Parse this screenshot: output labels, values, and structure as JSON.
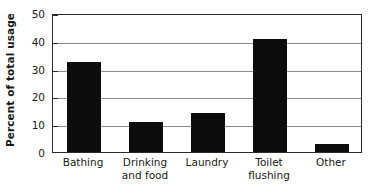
{
  "chart_data": {
    "type": "bar",
    "title": "",
    "xlabel": "",
    "ylabel": "Percent of total usage",
    "categories": [
      "Bathing",
      "Drinking\nand food",
      "Laundry",
      "Toilet\nflushing",
      "Other"
    ],
    "values": [
      32.5,
      10.8,
      14.0,
      40.5,
      3.0
    ],
    "ylim": [
      0,
      50
    ],
    "ytick_values": [
      0,
      10,
      20,
      30,
      40,
      50
    ],
    "ytick_labels": [
      "0",
      "10",
      "20",
      "30",
      "40",
      "50"
    ],
    "grid": "horizontal",
    "legend": "none",
    "bar_color": "#0c0c0c",
    "gridline_color": "#8c8c8c",
    "axis_color": "#2b2b2b",
    "background_color": "#ffffff"
  }
}
